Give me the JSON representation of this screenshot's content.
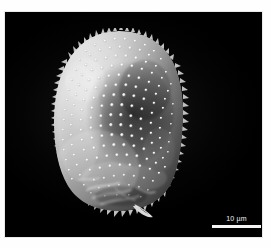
{
  "image": {
    "kind": "sem-micrograph",
    "subject": "echinate pollen grain",
    "background_color": "#000000",
    "mount_color": "#ffffff",
    "alt_text": "Scanning electron micrograph of a rounded, spiny (echinate) pollen grain on a black background"
  },
  "scale_bar": {
    "label": "10 µm",
    "value": "10",
    "unit": "µm",
    "bar_color": "#f4f4f4",
    "text_color": "#f2f2f2",
    "bar_length_px": "49"
  },
  "watermark": {
    "text": ""
  },
  "specimen": {
    "name": "pollen-grain",
    "surface": "echinate",
    "highlight_color": "#f0f0f0",
    "midtone_color": "#9a9a9a",
    "shadow_color": "#1b1b1b",
    "appendage": "basal protrusion"
  }
}
